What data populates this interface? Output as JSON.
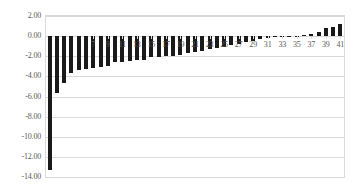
{
  "chart_data": {
    "type": "bar",
    "title": "",
    "subtitle": "",
    "xlabel": "",
    "ylabel": "",
    "ylim": [
      -14.0,
      2.0
    ],
    "ytick_labels": [
      "2.00",
      "0.00",
      "-2.00",
      "-4.00",
      "-6.00",
      "-8.00",
      "-10.00",
      "-12.00",
      "-14.00"
    ],
    "ytick_values": [
      2.0,
      0.0,
      -2.0,
      -4.0,
      -6.0,
      -8.0,
      -10.0,
      -12.0,
      -14.0
    ],
    "ytick_step": 2.0,
    "grid": true,
    "grid_axis": "y",
    "legend": false,
    "legend_position": "none",
    "bar_color": "#1a1a1a",
    "grid_color": "#d9d9d9",
    "axis_text_color": "#5a5a5a",
    "categories": [
      1,
      2,
      3,
      4,
      5,
      6,
      7,
      8,
      9,
      10,
      11,
      12,
      13,
      14,
      15,
      16,
      17,
      18,
      19,
      20,
      21,
      22,
      23,
      24,
      25,
      26,
      27,
      28,
      29,
      30,
      31,
      32,
      33,
      34,
      35,
      36,
      37,
      38,
      39,
      40,
      41
    ],
    "xtick_labels": [
      "7",
      "9",
      "11",
      "13",
      "15",
      "17",
      "19",
      "21",
      "23",
      "25",
      "27",
      "29",
      "31",
      "33",
      "35",
      "37",
      "39",
      "41"
    ],
    "xtick_label_categories": [
      7,
      9,
      11,
      13,
      15,
      17,
      19,
      21,
      23,
      25,
      27,
      29,
      31,
      33,
      35,
      37,
      39,
      41
    ],
    "values": [
      -13.3,
      -5.7,
      -4.7,
      -3.7,
      -3.35,
      -3.25,
      -3.2,
      -3.1,
      -2.95,
      -2.6,
      -2.55,
      -2.45,
      -2.4,
      -2.35,
      -2.1,
      -2.05,
      -2.0,
      -1.95,
      -1.85,
      -1.7,
      -1.6,
      -1.45,
      -1.3,
      -1.2,
      -1.05,
      -0.9,
      -0.75,
      -0.6,
      -0.45,
      -0.3,
      -0.18,
      -0.12,
      -0.08,
      -0.05,
      -0.02,
      0.1,
      0.22,
      0.4,
      0.85,
      0.95,
      1.2
    ]
  }
}
